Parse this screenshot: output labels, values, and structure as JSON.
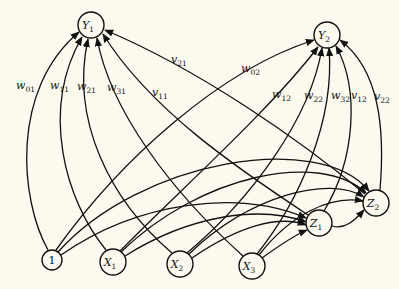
{
  "diagram": {
    "background": "#fcfaef",
    "stroke": "#111111",
    "nodes": [
      {
        "id": "one",
        "label": "1",
        "sub": "",
        "x": 52,
        "y": 260,
        "r": 10
      },
      {
        "id": "X1",
        "label": "X",
        "sub": "1",
        "x": 113,
        "y": 262,
        "r": 13
      },
      {
        "id": "X2",
        "label": "X",
        "sub": "2",
        "x": 180,
        "y": 264,
        "r": 13
      },
      {
        "id": "X3",
        "label": "X",
        "sub": "3",
        "x": 252,
        "y": 266,
        "r": 13
      },
      {
        "id": "Z1",
        "label": "Z",
        "sub": "1",
        "x": 319,
        "y": 223,
        "r": 13
      },
      {
        "id": "Z2",
        "label": "Z",
        "sub": "2",
        "x": 376,
        "y": 203,
        "r": 13
      },
      {
        "id": "Y1",
        "label": "Y",
        "sub": "1",
        "x": 91,
        "y": 25,
        "r": 13
      },
      {
        "id": "Y2",
        "label": "Y",
        "sub": "2",
        "x": 327,
        "y": 35,
        "r": 13
      }
    ],
    "edges": [
      {
        "from": "one",
        "to": "Y1",
        "label": "w",
        "sub": "01",
        "lx": 16,
        "ly": 89
      },
      {
        "from": "X1",
        "to": "Y1",
        "label": "w",
        "sub": "11",
        "lx": 50,
        "ly": 89
      },
      {
        "from": "X2",
        "to": "Y1",
        "label": "w",
        "sub": "21",
        "lx": 77,
        "ly": 90
      },
      {
        "from": "X3",
        "to": "Y1",
        "label": "w",
        "sub": "31",
        "lx": 107,
        "ly": 91
      },
      {
        "from": "Z1",
        "to": "Y1",
        "label": "v",
        "sub": "11",
        "lx": 152,
        "ly": 96
      },
      {
        "from": "Z2",
        "to": "Y1",
        "label": "v",
        "sub": "21",
        "lx": 171,
        "ly": 63
      },
      {
        "from": "one",
        "to": "Y2",
        "label": "w",
        "sub": "02",
        "lx": 241,
        "ly": 72
      },
      {
        "from": "X1",
        "to": "Y2",
        "label": "w",
        "sub": "12",
        "lx": 272,
        "ly": 98
      },
      {
        "from": "X2",
        "to": "Y2",
        "label": "w",
        "sub": "22",
        "lx": 304,
        "ly": 99
      },
      {
        "from": "X3",
        "to": "Y2",
        "label": "w",
        "sub": "32",
        "lx": 331,
        "ly": 99
      },
      {
        "from": "Z1",
        "to": "Y2",
        "label": "v",
        "sub": "12",
        "lx": 351,
        "ly": 99
      },
      {
        "from": "Z2",
        "to": "Y2",
        "label": "v",
        "sub": "22",
        "lx": 374,
        "ly": 100
      },
      {
        "from": "one",
        "to": "Z1",
        "label": "",
        "sub": ""
      },
      {
        "from": "X1",
        "to": "Z1",
        "label": "",
        "sub": ""
      },
      {
        "from": "X2",
        "to": "Z1",
        "label": "",
        "sub": ""
      },
      {
        "from": "X3",
        "to": "Z1",
        "label": "",
        "sub": ""
      },
      {
        "from": "one",
        "to": "Z2",
        "label": "",
        "sub": ""
      },
      {
        "from": "X1",
        "to": "Z2",
        "label": "",
        "sub": ""
      },
      {
        "from": "X2",
        "to": "Z2",
        "label": "",
        "sub": ""
      },
      {
        "from": "X3",
        "to": "Z2",
        "label": "",
        "sub": ""
      },
      {
        "from": "Z1",
        "to": "Z2",
        "label": "",
        "sub": ""
      }
    ]
  }
}
